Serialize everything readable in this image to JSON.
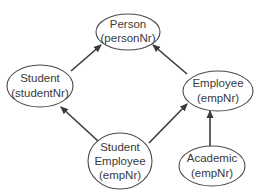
{
  "diagram": {
    "type": "class-hierarchy",
    "nodes": [
      {
        "id": "person",
        "label_line1": "Person",
        "label_line2": "(personNr)",
        "cx": 128,
        "cy": 32,
        "rx": 32,
        "ry": 18
      },
      {
        "id": "student",
        "label_line1": "Student",
        "label_line2": "(studentNr)",
        "cx": 40,
        "cy": 86,
        "rx": 33,
        "ry": 21
      },
      {
        "id": "employee",
        "label_line1": "Employee",
        "label_line2": "(empNr)",
        "cx": 218,
        "cy": 91,
        "rx": 35,
        "ry": 20
      },
      {
        "id": "student-employee",
        "label_line1": "Student",
        "label_line2": "Employee",
        "label_line3": "(empNr)",
        "cx": 120,
        "cy": 161,
        "rx": 32,
        "ry": 28
      },
      {
        "id": "academic",
        "label_line1": "Academic",
        "label_line2": "(empNr)",
        "cx": 212,
        "cy": 166,
        "rx": 33,
        "ry": 20
      }
    ],
    "edges": [
      {
        "from": "student",
        "to": "person"
      },
      {
        "from": "employee",
        "to": "person"
      },
      {
        "from": "student-employee",
        "to": "student"
      },
      {
        "from": "student-employee",
        "to": "employee"
      },
      {
        "from": "academic",
        "to": "employee"
      }
    ],
    "colors": {
      "stroke": "#3a3a3a",
      "fill": "#ffffff",
      "text": "#3a3a3a"
    }
  }
}
